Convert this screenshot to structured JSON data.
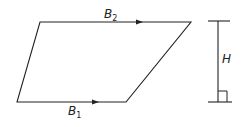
{
  "diagram": {
    "type": "trapezoid",
    "vertices": {
      "top_left": [
        40,
        22
      ],
      "top_right": [
        191,
        22
      ],
      "bottom_right": [
        126,
        102
      ],
      "bottom_left": [
        17,
        102
      ]
    },
    "colors": {
      "stroke": "#222222",
      "background": "#ffffff"
    },
    "labels": {
      "top_base": {
        "main": "B",
        "sub": "2"
      },
      "bottom_base": {
        "main": "B",
        "sub": "1"
      },
      "height": {
        "main": "H"
      }
    },
    "height_marker": {
      "x": 218,
      "top_y": 21,
      "bottom_y": 102,
      "right_angle": true
    }
  }
}
